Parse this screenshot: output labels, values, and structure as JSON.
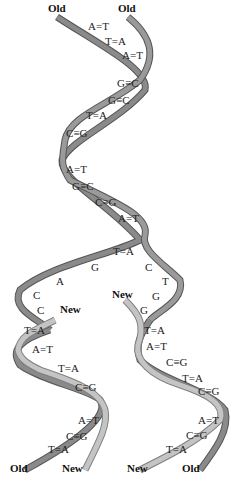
{
  "diagram": {
    "type": "DNA replication",
    "colors": {
      "old_strand": "#8a8a8a",
      "old_strand_edge": "#555555",
      "new_strand": "#c4c4c4",
      "new_strand_edge": "#808080",
      "text": "#222222"
    },
    "labels": {
      "top_left": "Old",
      "top_right": "Old",
      "fork_new_left": "New",
      "fork_new_right": "New",
      "bottom_left_1": "Old",
      "bottom_left_2": "New",
      "bottom_right_1": "New",
      "bottom_right_2": "Old"
    },
    "parent_helix_pairs": [
      "A=T",
      "T=A",
      "A=T",
      "G≡C",
      "G≡C",
      "T=A",
      "C≡G",
      "A=T",
      "G≡C",
      "C≡G",
      "A=T",
      "T=A"
    ],
    "fork_unpaired": {
      "left_strand": [
        "G",
        "A",
        "C",
        "C"
      ],
      "right_strand": [
        "C",
        "T",
        "G",
        "G"
      ]
    },
    "daughter_left_pairs": [
      "T=A",
      "A=T",
      "T=A",
      "C≡G",
      "A=T",
      "C≡G",
      "T=A"
    ],
    "daughter_right_pairs": [
      "T=A",
      "A=T",
      "C≡G",
      "T=A",
      "C≡G",
      "A=T",
      "C≡G",
      "T=A"
    ]
  }
}
